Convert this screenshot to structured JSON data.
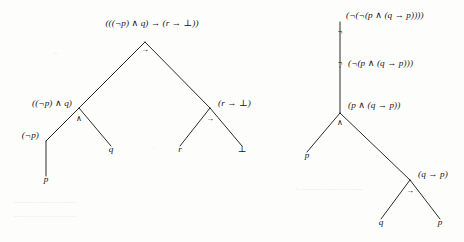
{
  "figure": {
    "kind": "parse-tree-pair",
    "ink_color": "#14140f",
    "paper_color": "#fdfdfc",
    "trees": [
      {
        "id": "left-tree",
        "root_formula": "(((¬p) ∧ q) → (r → ⊥))",
        "nodes": [
          {
            "id": "l-root",
            "label": "(((¬p) ∧ q) → (r → ⊥))",
            "connective": "→",
            "x": 145,
            "y": 42,
            "label_x": 152,
            "label_y": 24,
            "anchor": "mid",
            "conn_x": 145,
            "conn_y": 50
          },
          {
            "id": "l-and",
            "label": "((¬p) ∧ q)",
            "connective": "∧",
            "x": 79,
            "y": 108,
            "label_x": 72,
            "label_y": 104,
            "anchor": "right",
            "conn_x": 79,
            "conn_y": 119
          },
          {
            "id": "l-imp2",
            "label": "(r → ⊥)",
            "connective": "→",
            "x": 210,
            "y": 108,
            "label_x": 218,
            "label_y": 104,
            "anchor": "left",
            "conn_x": 210,
            "conn_y": 119
          },
          {
            "id": "l-not",
            "label": "(¬p)",
            "connective": "",
            "x": 46,
            "y": 141,
            "label_x": 39,
            "label_y": 136,
            "anchor": "right",
            "conn_x": 0,
            "conn_y": 0
          },
          {
            "id": "l-q",
            "label": "q",
            "connective": "",
            "x": 111,
            "y": 146,
            "label_x": 111,
            "label_y": 150,
            "anchor": "mid",
            "conn_x": 0,
            "conn_y": 0
          },
          {
            "id": "l-r",
            "label": "r",
            "connective": "",
            "x": 180,
            "y": 146,
            "label_x": 180,
            "label_y": 150,
            "anchor": "mid",
            "conn_x": 0,
            "conn_y": 0
          },
          {
            "id": "l-bot",
            "label": "⊥",
            "connective": "",
            "x": 242,
            "y": 146,
            "label_x": 242,
            "label_y": 150,
            "anchor": "mid",
            "conn_x": 0,
            "conn_y": 0
          },
          {
            "id": "l-p",
            "label": "p",
            "connective": "",
            "x": 46,
            "y": 176,
            "label_x": 46,
            "label_y": 180,
            "anchor": "mid",
            "conn_x": 0,
            "conn_y": 0
          }
        ],
        "edges": [
          {
            "from": "l-root",
            "to": "l-and"
          },
          {
            "from": "l-root",
            "to": "l-imp2"
          },
          {
            "from": "l-and",
            "to": "l-not"
          },
          {
            "from": "l-and",
            "to": "l-q"
          },
          {
            "from": "l-imp2",
            "to": "l-r"
          },
          {
            "from": "l-imp2",
            "to": "l-bot"
          },
          {
            "from": "l-not",
            "to": "l-p"
          }
        ]
      },
      {
        "id": "right-tree",
        "root_formula": "(¬(¬(p ∧ (q → p))))",
        "nodes": [
          {
            "id": "r-root",
            "label": "(¬(¬(p ∧ (q → p))))",
            "connective": "¬",
            "x": 340,
            "y": 22,
            "label_x": 346,
            "label_y": 16,
            "anchor": "left",
            "conn_x": 340,
            "conn_y": 32
          },
          {
            "id": "r-not2",
            "label": "(¬(p ∧ (q → p)))",
            "connective": "¬",
            "x": 340,
            "y": 67,
            "label_x": 348,
            "label_y": 64,
            "anchor": "left",
            "conn_x": 340,
            "conn_y": 63
          },
          {
            "id": "r-and",
            "label": "(p ∧ (q → p))",
            "connective": "∧",
            "x": 340,
            "y": 113,
            "label_x": 348,
            "label_y": 106,
            "anchor": "left",
            "conn_x": 340,
            "conn_y": 123
          },
          {
            "id": "r-p",
            "label": "p",
            "connective": "",
            "x": 307,
            "y": 152,
            "label_x": 307,
            "label_y": 156,
            "anchor": "mid",
            "conn_x": 0,
            "conn_y": 0
          },
          {
            "id": "r-imp",
            "label": "(q → p)",
            "connective": "→",
            "x": 410,
            "y": 180,
            "label_x": 418,
            "label_y": 175,
            "anchor": "left",
            "conn_x": 410,
            "conn_y": 191
          },
          {
            "id": "r-q",
            "label": "q",
            "connective": "",
            "x": 381,
            "y": 219,
            "label_x": 381,
            "label_y": 223,
            "anchor": "mid",
            "conn_x": 0,
            "conn_y": 0
          },
          {
            "id": "r-p2",
            "label": "p",
            "connective": "",
            "x": 440,
            "y": 219,
            "label_x": 440,
            "label_y": 223,
            "anchor": "mid",
            "conn_x": 0,
            "conn_y": 0
          }
        ],
        "edges": [
          {
            "from": "r-root",
            "to": "r-not2"
          },
          {
            "from": "r-not2",
            "to": "r-and"
          },
          {
            "from": "r-and",
            "to": "r-p"
          },
          {
            "from": "r-and",
            "to": "r-imp"
          },
          {
            "from": "r-imp",
            "to": "r-q"
          },
          {
            "from": "r-imp",
            "to": "r-p2"
          }
        ]
      }
    ],
    "background_artifacts": [
      {
        "text": "bleed-through line",
        "x": 14,
        "y": 198
      },
      {
        "text": "bleed-through line",
        "x": 300,
        "y": 185
      },
      {
        "text": "bleed-through line",
        "x": 14,
        "y": 212
      }
    ]
  }
}
